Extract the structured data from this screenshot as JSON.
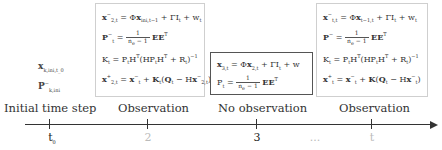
{
  "initial": {
    "state": "x",
    "state_sub": "k,ini,t_0",
    "cov": "P",
    "cov_sub": "k,ini"
  },
  "boxes": [
    {
      "id": "observation-step-2",
      "style": "light",
      "equations": [
        "x⁻_{2,t} = Φ x_{ini,t-1} + Γ I_t + w_t",
        "P⁻_t = 1/(n_e − 1) · E Eᵀ",
        "K_t = P_t Hᵀ (H P_t Hᵀ + R_t)⁻¹",
        "x⁺_{2,t} = x⁻_t + K_t (Q_t − H x⁻_{2,t})"
      ]
    },
    {
      "id": "no-observation-step-3",
      "style": "dark",
      "equations": [
        "x_{3,t} = Φ x_{2,t} + Γ I_t + w",
        "P_t = 1/(n_e − 1) · E Eᵀ"
      ]
    },
    {
      "id": "observation-step-t",
      "style": "light",
      "equations": [
        "x⁻_{t,t} = Φ x_{t-1,t} + Γ I_t + w_t",
        "P⁻ = 1/(n_e − 1) · E Eᵀ",
        "K_t = P_t Hᵀ (H P_t Hᵀ + R_t)⁻¹",
        "x⁺_t = x⁻_t + K (Q_t − H x⁻_t)"
      ]
    }
  ],
  "labels": {
    "initial": "Initial time step",
    "obs1": "Observation",
    "noobs": "No observation",
    "obs2": "Observation"
  },
  "ticks": {
    "t0": "t",
    "t0_sub": "0",
    "t2": "2",
    "t3": "3",
    "ellipsis": "...",
    "tt": "t"
  },
  "colors": {
    "axis": "#333333",
    "faded_tick": "#bbbbbb",
    "light_border": "#cfcfcf",
    "dark_border": "#555555"
  }
}
